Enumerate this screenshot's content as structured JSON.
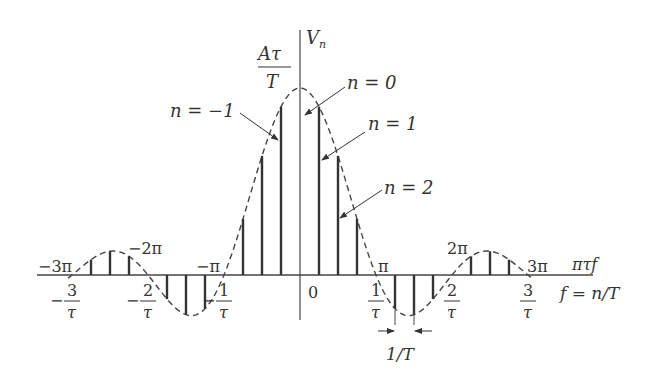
{
  "chart_data": {
    "type": "stem",
    "title": "",
    "ylabel": "V_n",
    "peak_label": {
      "num": "Aτ",
      "den": "T"
    },
    "envelope": "sinc (dashed)",
    "tau_over_T": 0.25,
    "x_axis_labels": {
      "top_axis_name": "πτf",
      "bottom_axis_name": "f = n/T",
      "top_ticks": [
        "−3π",
        "−2π",
        "−π",
        "π",
        "2π",
        "3π"
      ],
      "bottom_ticks": [
        {
          "sign": "−",
          "num": "3",
          "den": "τ"
        },
        {
          "sign": "−",
          "num": "2",
          "den": "τ"
        },
        {
          "sign": "−",
          "num": "1",
          "den": "τ"
        },
        {
          "sign": "",
          "num": "0",
          "den": ""
        },
        {
          "sign": "",
          "num": "1",
          "den": "τ"
        },
        {
          "sign": "",
          "num": "2",
          "den": "τ"
        },
        {
          "sign": "",
          "num": "3",
          "den": "τ"
        }
      ]
    },
    "annotations": [
      "n = 0",
      "n = 1",
      "n = −1",
      "n = 2",
      "1/T"
    ],
    "n": [
      -11,
      -10,
      -9,
      -8,
      -7,
      -6,
      -5,
      -4,
      -3,
      -2,
      -1,
      0,
      1,
      2,
      3,
      4,
      5,
      6,
      7,
      8,
      9,
      10,
      11
    ],
    "values_normalized": [
      0.082,
      0.127,
      0.1,
      0,
      -0.129,
      -0.212,
      -0.18,
      0,
      0.3,
      0.637,
      0.9,
      1.0,
      0.9,
      0.637,
      0.3,
      0,
      -0.18,
      -0.212,
      -0.129,
      0,
      0.1,
      0.127,
      0.082
    ]
  }
}
